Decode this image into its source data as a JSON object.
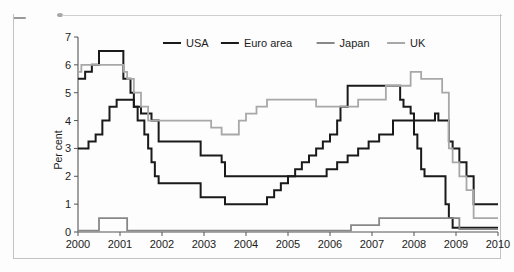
{
  "chart_data": {
    "type": "line",
    "title": "",
    "subtitle": "",
    "xlabel": "",
    "ylabel": "Per cent",
    "xlim": [
      2000,
      2010
    ],
    "ylim": [
      0,
      7
    ],
    "ytick_labels": [
      "0",
      "1",
      "2",
      "3",
      "4",
      "5",
      "6",
      "7"
    ],
    "yticks": [
      0,
      1,
      2,
      3,
      4,
      5,
      6,
      7
    ],
    "xtick_labels": [
      "2000",
      "2001",
      "2002",
      "2003",
      "2004",
      "2005",
      "2006",
      "2007",
      "2008",
      "2009",
      "2010"
    ],
    "xticks": [
      2000,
      2001,
      2002,
      2003,
      2004,
      2005,
      2006,
      2007,
      2008,
      2009,
      2010
    ],
    "grid": false,
    "legend_position": "top-center",
    "step_style": "post",
    "series": [
      {
        "name": "USA",
        "color": "#1a1a1a",
        "width": 2.0,
        "x": [
          2000.0,
          2000.17,
          2000.33,
          2000.5,
          2001.08,
          2001.25,
          2001.33,
          2001.42,
          2001.58,
          2001.67,
          2001.75,
          2001.83,
          2001.92,
          2002.92,
          2003.5,
          2004.5,
          2004.67,
          2004.83,
          2005.0,
          2005.17,
          2005.33,
          2005.5,
          2005.67,
          2005.83,
          2006.0,
          2006.17,
          2006.25,
          2006.42,
          2007.67,
          2007.75,
          2007.92,
          2008.0,
          2008.08,
          2008.17,
          2008.25,
          2008.33,
          2008.75,
          2008.83,
          2008.92,
          2010.0
        ],
        "y": [
          5.5,
          5.75,
          6.0,
          6.5,
          5.5,
          5.0,
          4.5,
          4.0,
          3.5,
          3.0,
          2.5,
          2.0,
          1.75,
          1.25,
          1.0,
          1.25,
          1.5,
          1.75,
          2.0,
          2.25,
          2.5,
          2.75,
          3.0,
          3.25,
          3.5,
          4.0,
          4.5,
          5.25,
          4.75,
          4.5,
          4.25,
          3.5,
          3.0,
          2.25,
          2.0,
          2.0,
          1.0,
          0.5,
          0.15,
          0.15
        ]
      },
      {
        "name": "Euro area",
        "color": "#1a1a1a",
        "width": 2.0,
        "x": [
          2000.0,
          2000.25,
          2000.42,
          2000.58,
          2000.75,
          2000.92,
          2001.33,
          2001.5,
          2001.75,
          2001.92,
          2002.92,
          2003.42,
          2003.5,
          2005.92,
          2006.17,
          2006.42,
          2006.67,
          2006.92,
          2007.17,
          2007.5,
          2008.5,
          2008.58,
          2008.83,
          2008.92,
          2009.08,
          2009.25,
          2009.42,
          2010.0
        ],
        "y": [
          3.0,
          3.25,
          3.5,
          4.0,
          4.5,
          4.75,
          4.5,
          4.25,
          4.0,
          3.25,
          2.75,
          2.5,
          2.0,
          2.25,
          2.5,
          2.75,
          3.0,
          3.25,
          3.5,
          4.0,
          4.25,
          4.0,
          3.25,
          3.0,
          2.5,
          2.0,
          1.0,
          1.0
        ]
      },
      {
        "name": "Japan",
        "color": "#888888",
        "width": 1.8,
        "x": [
          2000.0,
          2000.5,
          2001.0,
          2001.17,
          2006.5,
          2007.17,
          2008.92,
          2009.08,
          2010.0
        ],
        "y": [
          0.05,
          0.5,
          0.5,
          0.05,
          0.25,
          0.5,
          0.5,
          0.1,
          0.1
        ]
      },
      {
        "name": "UK",
        "color": "#a8a8a8",
        "width": 1.8,
        "x": [
          2000.0,
          2000.08,
          2001.08,
          2001.17,
          2001.33,
          2001.5,
          2001.67,
          2001.83,
          2003.17,
          2003.42,
          2003.83,
          2004.0,
          2004.25,
          2004.5,
          2005.67,
          2006.67,
          2007.33,
          2007.92,
          2008.17,
          2008.67,
          2008.83,
          2008.92,
          2009.08,
          2009.25,
          2009.42,
          2010.0
        ],
        "y": [
          5.75,
          6.0,
          5.75,
          5.5,
          5.0,
          4.5,
          4.0,
          4.0,
          3.75,
          3.5,
          4.0,
          4.25,
          4.5,
          4.75,
          4.5,
          4.75,
          5.25,
          5.75,
          5.5,
          5.0,
          3.0,
          2.5,
          2.0,
          1.5,
          0.5,
          0.5
        ]
      }
    ],
    "legend": [
      {
        "label": "USA",
        "color": "#1a1a1a"
      },
      {
        "label": "Euro area",
        "color": "#1a1a1a"
      },
      {
        "label": "Japan",
        "color": "#888888"
      },
      {
        "label": "UK",
        "color": "#a8a8a8"
      }
    ]
  }
}
